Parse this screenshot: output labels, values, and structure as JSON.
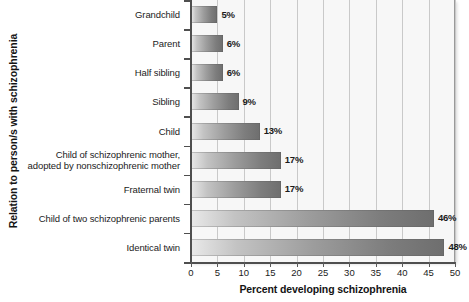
{
  "chart_data": {
    "type": "bar",
    "orientation": "horizontal",
    "title": "",
    "xlabel": "Percent developing schizophrenia",
    "ylabel": "Relation to person/s with schizophrenia",
    "xlim": [
      0,
      50
    ],
    "xticks": [
      0,
      5,
      10,
      15,
      20,
      25,
      30,
      35,
      40,
      45,
      50
    ],
    "xtick_labels": [
      "0",
      "5",
      "10",
      "15",
      "20",
      "25",
      "30",
      "35",
      "40",
      "45",
      "50"
    ],
    "grid": "vertical",
    "legend": "none",
    "categories": [
      "Grandchild",
      "Parent",
      "Half sibling",
      "Sibling",
      "Child",
      "Child of schizophrenic mother, adopted by nonschizophrenic mother",
      "Fraternal twin",
      "Child of two schizophrenic parents",
      "Identical twin"
    ],
    "values": [
      5,
      6,
      6,
      9,
      13,
      17,
      17,
      46,
      48
    ],
    "value_labels": [
      "5%",
      "6%",
      "6%",
      "9%",
      "13%",
      "17%",
      "17%",
      "46%",
      "48%"
    ],
    "bars": [
      {
        "category": "Grandchild",
        "category_lines": [
          "Grandchild"
        ],
        "value": 5,
        "label": "5%"
      },
      {
        "category": "Parent",
        "category_lines": [
          "Parent"
        ],
        "value": 6,
        "label": "6%"
      },
      {
        "category": "Half sibling",
        "category_lines": [
          "Half sibling"
        ],
        "value": 6,
        "label": "6%"
      },
      {
        "category": "Sibling",
        "category_lines": [
          "Sibling"
        ],
        "value": 9,
        "label": "9%"
      },
      {
        "category": "Child",
        "category_lines": [
          "Child"
        ],
        "value": 13,
        "label": "13%"
      },
      {
        "category": "Child of schizophrenic mother, adopted by nonschizophrenic mother",
        "category_lines": [
          "Child of schizophrenic mother,",
          "adopted by nonschizophrenic mother"
        ],
        "value": 17,
        "label": "17%"
      },
      {
        "category": "Fraternal twin",
        "category_lines": [
          "Fraternal twin"
        ],
        "value": 17,
        "label": "17%"
      },
      {
        "category": "Child of two schizophrenic parents",
        "category_lines": [
          "Child of two schizophrenic parents"
        ],
        "value": 46,
        "label": "46%"
      },
      {
        "category": "Identical twin",
        "category_lines": [
          "Identical twin"
        ],
        "value": 48,
        "label": "48%"
      }
    ],
    "colors": {
      "bar_gradient_start": "#e9e9e9",
      "bar_gradient_end": "#6e6e6e",
      "plot_background": "#f7f7f7",
      "gridline": "#c9c9c9",
      "axis": "#4f4f4f",
      "text": "#1b1b1b"
    }
  }
}
